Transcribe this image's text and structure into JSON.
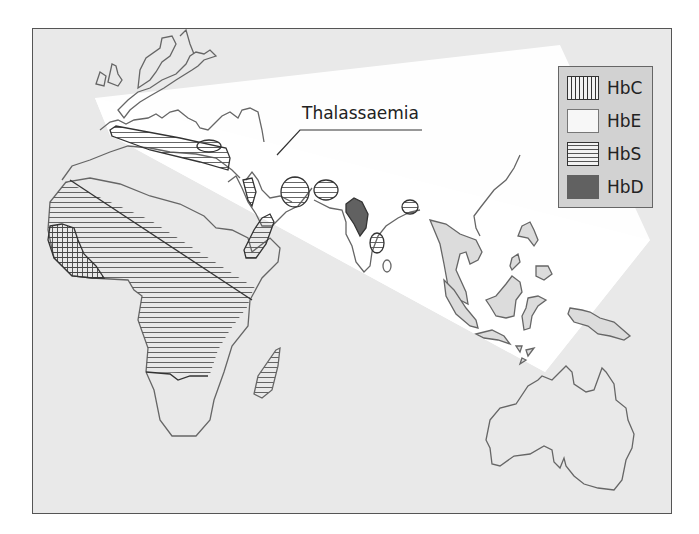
{
  "figure": {
    "title_annotation": "Thalassaemia",
    "legend": {
      "items": [
        {
          "label": "HbC",
          "pattern": "vertical-hatch",
          "color": "#f2f2f2"
        },
        {
          "label": "HbE",
          "pattern": "solid",
          "color": "#f7f7f7"
        },
        {
          "label": "HbS",
          "pattern": "horizontal-hatch",
          "color": "#f2f2f2"
        },
        {
          "label": "HbD",
          "pattern": "solid",
          "color": "#616161"
        }
      ]
    },
    "colors": {
      "background": "#e9e9e9",
      "thalassaemia_band": "#ffffff",
      "coastline": "#666666",
      "hatch_line": "#555555",
      "hbd_fill": "#616161",
      "legend_bg": "#d2d2d2"
    },
    "regions": [
      "Europe",
      "Mediterranean",
      "Africa",
      "Madagascar",
      "Arabian Peninsula",
      "India",
      "Southeast Asia",
      "Indonesia",
      "Australia"
    ]
  }
}
